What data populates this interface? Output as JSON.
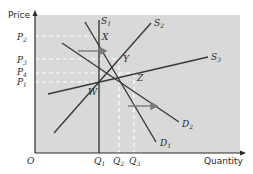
{
  "diagram": {
    "type": "supply-demand",
    "axes": {
      "y_label": "Price",
      "x_label": "Quantity",
      "origin": "O"
    },
    "price_levels": [
      {
        "name": "P",
        "sub": "2",
        "y": 36
      },
      {
        "name": "P",
        "sub": "3",
        "y": 59
      },
      {
        "name": "P",
        "sub": "4",
        "y": 73
      },
      {
        "name": "P",
        "sub": "1",
        "y": 82
      }
    ],
    "quantity_levels": [
      {
        "name": "Q",
        "sub": "1",
        "x": 99
      },
      {
        "name": "Q",
        "sub": "2",
        "x": 119
      },
      {
        "name": "Q",
        "sub": "3",
        "x": 134
      }
    ],
    "curves": {
      "S1": {
        "name": "S",
        "sub": "1"
      },
      "S2": {
        "name": "S",
        "sub": "2"
      },
      "S3": {
        "name": "S",
        "sub": "3"
      },
      "D1": {
        "name": "D",
        "sub": "1"
      },
      "D2": {
        "name": "D",
        "sub": "2"
      }
    },
    "points": {
      "W": "W",
      "X": "X",
      "Y": "Y",
      "Z": "Z"
    },
    "colors": {
      "plot_bg": "#d9d9d9",
      "line": "#3a3a3a",
      "dash": "#ffffff",
      "arrow": "#7a7a7a"
    }
  }
}
